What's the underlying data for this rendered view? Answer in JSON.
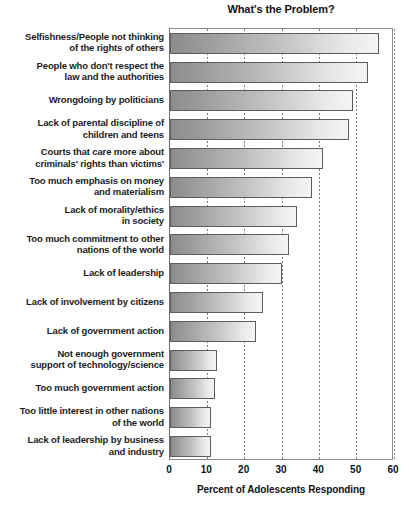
{
  "chart_data": {
    "type": "bar",
    "orientation": "horizontal",
    "title": "What's the Problem?",
    "xlabel": "Percent of Adolescents Responding",
    "ylabel": "",
    "xlim": [
      0,
      60
    ],
    "xticks": [
      0,
      10,
      20,
      30,
      40,
      50,
      60
    ],
    "xtick_labels": [
      "0",
      "10",
      "20",
      "30",
      "40",
      "50",
      "60"
    ],
    "grid": true,
    "grid_axis": "x",
    "grid_style": "dotted",
    "legend": false,
    "bar_fill": "gradient-gray-left-dark-to-right-light",
    "bar_border_color": "#5d5d5d",
    "categories": [
      "Selfishness/People not thinking\nof the rights of others",
      "People who don't respect the\nlaw and the authorities",
      "Wrongdoing by politicians",
      "Lack of parental discipline of\nchildren and teens",
      "Courts that care more about\ncriminals' rights than victims'",
      "Too much emphasis on money\nand materialism",
      "Lack of morality/ethics\nin society",
      "Too much commitment to other\nnations of the world",
      "Lack of leadership",
      "Lack of involvement by citizens",
      "Lack of government action",
      "Not enough government\nsupport of technology/science",
      "Too much government action",
      "Too little interest in other nations\nof the world",
      "Lack of leadership by business\nand industry"
    ],
    "values": [
      56,
      53,
      49,
      48,
      41,
      38,
      34,
      32,
      30,
      25,
      23,
      12.5,
      12,
      11,
      11
    ]
  }
}
